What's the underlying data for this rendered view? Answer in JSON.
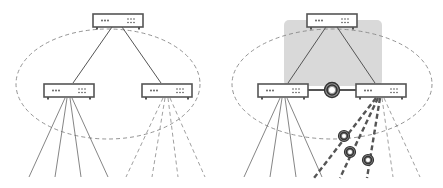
{
  "diagram": {
    "type": "network-topology-comparison",
    "colors": {
      "line": "#555555",
      "dashed": "#888888",
      "highlight_box": "#d9d9d9",
      "switch_fill": "#ffffff",
      "switch_stroke": "#555555",
      "ring": "#444444"
    },
    "panels": [
      {
        "name": "left-panel",
        "description": "Switch hierarchy with one top switch, two child switches; left child has solid links, right child dashed links",
        "switches": [
          "top-switch",
          "left-switch",
          "right-switch"
        ],
        "solid_links": 4,
        "dashed_links": 4
      },
      {
        "name": "right-panel",
        "description": "Same hierarchy with highlighted shared group, inter-switch link with ring node, and heavy dashed links with ring nodes",
        "switches": [
          "top-switch",
          "left-switch",
          "right-switch"
        ],
        "solid_links": 4,
        "heavy_dashed_links": 3,
        "dashed_links": 2,
        "ring_nodes": 4
      }
    ]
  }
}
